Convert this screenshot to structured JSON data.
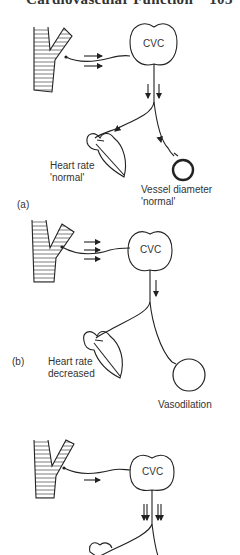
{
  "header": {
    "title": "Cardiovascular Function",
    "page": "103"
  },
  "panels": [
    {
      "label": "(a)",
      "center": "CVC",
      "afferent_arrows": 2,
      "efferent_arrows_per_side": 1,
      "heart_label_line1": "Heart rate",
      "heart_label_line2": "'normal'",
      "vessel_label_line1": "Vessel diameter",
      "vessel_label_line2": "'normal'"
    },
    {
      "label": "(b)",
      "center": "CVC",
      "afferent_arrows": 3,
      "efferent_arrows_per_side": 1,
      "heart_label_line1": "Heart rate",
      "heart_label_line2": "decreased",
      "vessel_label_line1": "Vasodilation"
    },
    {
      "label": "",
      "center": "CVC",
      "afferent_arrows": 1,
      "efferent_arrows_per_side": 2
    }
  ]
}
